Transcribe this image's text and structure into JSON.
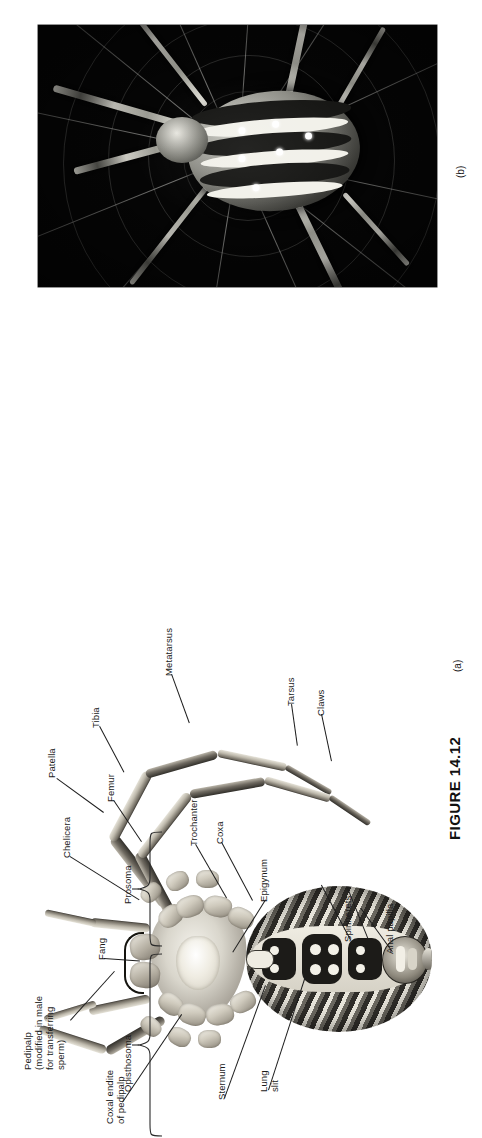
{
  "figure": {
    "caption": "FIGURE 14.12",
    "panels": [
      {
        "id": "a",
        "label": "(a)",
        "kind": "anatomical-drawing",
        "subject": "Spider ventral view"
      },
      {
        "id": "b",
        "label": "(b)",
        "kind": "photograph",
        "subject": "Orb-weaving spider on web"
      }
    ]
  },
  "labels": {
    "patella": "Patella",
    "tibia": "Tibia",
    "metatarsus": "Metatarsus",
    "tarsus": "Tarsus",
    "claws": "Claws",
    "femur": "Femur",
    "trochanter": "Trochanter",
    "coxa": "Coxa",
    "chelicera": "Chelicera",
    "fang": "Fang",
    "pedipalp": "Pedipalp\n(modified in male\nfor transferring\nsperm)",
    "coxal_endite": "Coxal endite\nof pedipalp",
    "sternum": "Sternum",
    "lung_slit": "Lung\nslit",
    "epigynum": "Epigynum",
    "spinnerets": "Spinnerets",
    "anal_papilla": "Anal papilla"
  },
  "braces": {
    "prosoma": "Prosoma",
    "opisthosoma": "Opisthosoma"
  },
  "colors": {
    "page_background": "#ffffff",
    "ink": "#1a1a1a",
    "photo_background": "#050505",
    "leader_line": "#1d1d1d"
  }
}
